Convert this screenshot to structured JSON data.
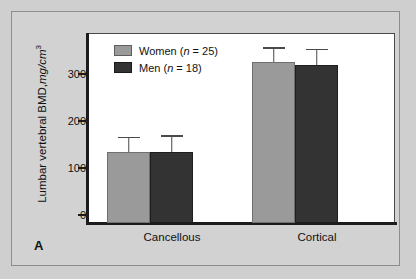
{
  "figure": {
    "panel_label": "A",
    "background_color": "#d2d2d2",
    "border_color": "#8d8d8d"
  },
  "legend": {
    "position": "top-left inside plot",
    "entries": [
      {
        "label_prefix": "Women (",
        "label_italic": "n",
        "label_suffix": " = 25)",
        "full": "Women (n = 25)",
        "color": "#9a9a9a",
        "swatch_name": "women-swatch"
      },
      {
        "label_prefix": "Men (",
        "label_italic": "n",
        "label_suffix": " = 18)",
        "full": "Men (n = 18)",
        "color": "#333333",
        "swatch_name": "men-swatch"
      }
    ]
  },
  "axis": {
    "y_title_main": "Lumbar vertebral BMD,",
    "y_title_unit": "mg/cm",
    "y_title_exponent": "3",
    "y_ticks": [
      "0",
      "100",
      "200",
      "300"
    ],
    "x_ticks": [
      "Cancellous",
      "Cortical"
    ]
  },
  "chart_data": {
    "type": "bar",
    "title": "",
    "xlabel": "",
    "ylabel": "Lumbar vertebral BMD, mg/cm3",
    "ylim": [
      0,
      400
    ],
    "yticks": [
      0,
      100,
      200,
      300
    ],
    "grid": false,
    "legend_position": "upper left",
    "categories": [
      "Cancellous",
      "Cortical"
    ],
    "series": [
      {
        "name": "Women (n = 25)",
        "color": "#9a9a9a",
        "values": [
          150,
          338
        ],
        "errors_upper": [
          32,
          32
        ]
      },
      {
        "name": "Men (n = 18)",
        "color": "#333333",
        "values": [
          150,
          333
        ],
        "errors_upper": [
          35,
          34
        ]
      }
    ]
  }
}
